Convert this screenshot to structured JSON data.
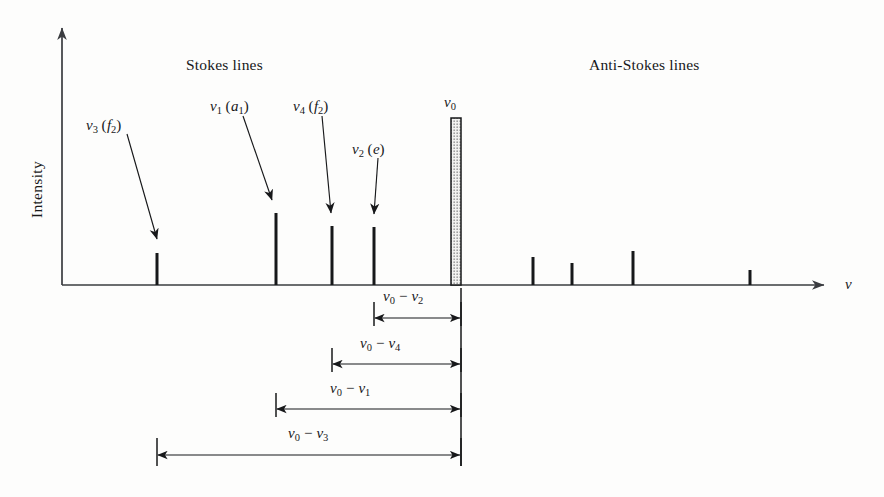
{
  "figure": {
    "type": "raman-spectrum-schematic",
    "axes": {
      "y_label": "Intensity",
      "x_label": "ν",
      "x_label_name": "nu",
      "origin_px": [
        62,
        285
      ],
      "x_axis_end_px": [
        836,
        285
      ],
      "y_axis_top_px": [
        62,
        22
      ]
    },
    "headings": [
      {
        "text": "Stokes lines",
        "x": 186,
        "y": 57
      },
      {
        "text": "Anti-Stokes lines",
        "x": 589,
        "y": 57
      }
    ],
    "peak_labels": [
      {
        "id": "nu3",
        "base": "ν",
        "sub": "3",
        "paren": "f",
        "paren_sub": "2",
        "x": 86,
        "y": 118,
        "leader_from": [
          127,
          134
        ],
        "leader_to": [
          157,
          239
        ]
      },
      {
        "id": "nu1",
        "base": "ν",
        "sub": "1",
        "paren": "a",
        "paren_sub": "1",
        "x": 210,
        "y": 99,
        "leader_from": [
          243,
          116
        ],
        "leader_to": [
          272,
          200
        ]
      },
      {
        "id": "nu4",
        "base": "ν",
        "sub": "4",
        "paren": "f",
        "paren_sub": "2",
        "x": 293,
        "y": 99,
        "leader_from": [
          322,
          116
        ],
        "leader_to": [
          331,
          213
        ]
      },
      {
        "id": "nu2",
        "base": "ν",
        "sub": "2",
        "paren": "e",
        "paren_sub": "",
        "x": 352,
        "y": 142,
        "leader_from": [
          378,
          158
        ],
        "leader_to": [
          374,
          214
        ]
      },
      {
        "id": "nu0",
        "base": "ν",
        "sub": "0",
        "paren": "",
        "paren_sub": "",
        "x": 444,
        "y": 95
      }
    ],
    "colors": {
      "ink": "#17181a",
      "axis": "#3a3c40",
      "background": "#fdfdfc",
      "exciting_line_fill": "#e8e8e6",
      "exciting_line_stroke": "#17181a"
    }
  },
  "chart_data": {
    "type": "bar",
    "title": "",
    "xlabel": "ν",
    "ylabel": "Intensity",
    "grid": false,
    "legend": null,
    "baseline_y_px": 285,
    "series": [
      {
        "name": "Stokes lines",
        "points": [
          {
            "label": "ν3 (f2)",
            "x_px": 157,
            "top_px": 253,
            "height_px": 32,
            "width_px": 3
          },
          {
            "label": "ν1 (a1)",
            "x_px": 276,
            "top_px": 213,
            "height_px": 72,
            "width_px": 3
          },
          {
            "label": "ν4 (f2)",
            "x_px": 332,
            "top_px": 226,
            "height_px": 59,
            "width_px": 3
          },
          {
            "label": "ν2 (e)",
            "x_px": 374,
            "top_px": 227,
            "height_px": 58,
            "width_px": 3
          }
        ]
      },
      {
        "name": "Exciting line",
        "points": [
          {
            "label": "ν0",
            "x_px": 456,
            "top_px": 118,
            "height_px": 167,
            "width_px": 10
          }
        ]
      },
      {
        "name": "Anti-Stokes lines",
        "points": [
          {
            "label": "",
            "x_px": 533,
            "top_px": 257,
            "height_px": 28,
            "width_px": 3
          },
          {
            "label": "",
            "x_px": 572,
            "top_px": 263,
            "height_px": 22,
            "width_px": 3
          },
          {
            "label": "",
            "x_px": 633,
            "top_px": 251,
            "height_px": 34,
            "width_px": 3
          },
          {
            "label": "",
            "x_px": 750,
            "top_px": 270,
            "height_px": 15,
            "width_px": 3
          }
        ]
      }
    ]
  },
  "dimensions": [
    {
      "id": "d_nu0_nu2",
      "base": "ν",
      "sub_a": "0",
      "op": "−",
      "sub_b": "2",
      "label_x": 383,
      "label_y": 289,
      "line_y": 318,
      "x_left": 374,
      "x_right": 461,
      "tick_top": 302,
      "tick_bottom": 326
    },
    {
      "id": "d_nu0_nu4",
      "base": "ν",
      "sub_a": "0",
      "op": "−",
      "sub_b": "4",
      "label_x": 360,
      "label_y": 336,
      "line_y": 364,
      "x_left": 332,
      "x_right": 461,
      "tick_top": 348,
      "tick_bottom": 372
    },
    {
      "id": "d_nu0_nu1",
      "base": "ν",
      "sub_a": "0",
      "op": "−",
      "sub_b": "1",
      "label_x": 330,
      "label_y": 381,
      "line_y": 409,
      "x_left": 276,
      "x_right": 461,
      "tick_top": 393,
      "tick_bottom": 417
    },
    {
      "id": "d_nu0_nu3",
      "base": "ν",
      "sub_a": "0",
      "op": "−",
      "sub_b": "3",
      "label_x": 288,
      "label_y": 426,
      "line_y": 455,
      "x_left": 157,
      "x_right": 461,
      "tick_top": 438,
      "tick_bottom": 466
    }
  ]
}
